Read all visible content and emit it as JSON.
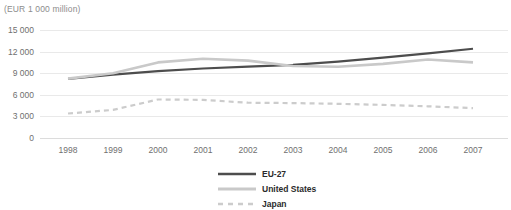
{
  "chart_data": {
    "type": "line",
    "title": "(EUR 1 000 million)",
    "xlabel": "",
    "ylabel": "",
    "unit_note": "(EUR 1 000 million)",
    "categories": [
      "1998",
      "1999",
      "2000",
      "2001",
      "2002",
      "2003",
      "2004",
      "2005",
      "2006",
      "2007"
    ],
    "x": [
      1998,
      1999,
      2000,
      2001,
      2002,
      2003,
      2004,
      2005,
      2006,
      2007
    ],
    "ylim": [
      0,
      15000
    ],
    "yticks": [
      0,
      3000,
      6000,
      9000,
      12000,
      15000
    ],
    "ytick_labels": [
      "0",
      "3 000",
      "6 000",
      "9 000",
      "12 000",
      "15 000"
    ],
    "grid": true,
    "legend_position": "bottom-center",
    "series": [
      {
        "name": "EU-27",
        "color": "#4d4d4d",
        "style": "solid",
        "width": 2.2,
        "values": [
          8200,
          8800,
          9300,
          9650,
          9900,
          10150,
          10600,
          11150,
          11750,
          12400
        ]
      },
      {
        "name": "United States",
        "color": "#c9c9c9",
        "style": "solid",
        "width": 2.6,
        "values": [
          8250,
          9000,
          10500,
          11000,
          10750,
          10000,
          9900,
          10300,
          10900,
          10500
        ]
      },
      {
        "name": "Japan",
        "color": "#cccccc",
        "style": "dashed",
        "width": 2.2,
        "values": [
          3400,
          3900,
          5350,
          5300,
          4900,
          4850,
          4750,
          4600,
          4400,
          4150
        ]
      }
    ]
  },
  "legend": {
    "items": [
      {
        "label": "EU-27"
      },
      {
        "label": "United States"
      },
      {
        "label": "Japan"
      }
    ]
  }
}
